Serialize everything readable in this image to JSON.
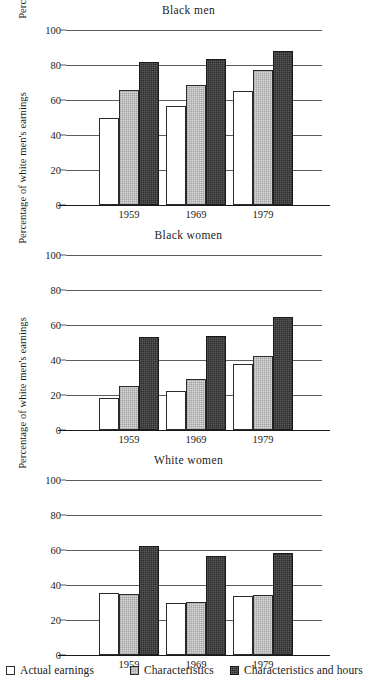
{
  "figure": {
    "ylabel": "Percentage of white men's earnings",
    "y_ticks": [
      "0",
      "20",
      "40",
      "60",
      "80",
      "100"
    ],
    "x_ticks": [
      "1959",
      "1969",
      "1979"
    ],
    "legend": [
      {
        "label": "Actual earnings",
        "swatch": "open-white-square",
        "color": "#ffffff"
      },
      {
        "label": "Characteristics",
        "swatch": "light-gray-stippled-square",
        "color": "#d9d9d9"
      },
      {
        "label": "Characteristics and hours",
        "swatch": "dark-gray-square",
        "color": "#2e2e2e"
      }
    ]
  },
  "panels": [
    {
      "title": "Black men"
    },
    {
      "title": "Black women"
    },
    {
      "title": "White women"
    }
  ],
  "chart_data": [
    {
      "type": "bar",
      "title": "Black men",
      "xlabel": "",
      "ylabel": "Percentage of white men's earnings",
      "categories": [
        "1959",
        "1969",
        "1979"
      ],
      "ylim": [
        0,
        100
      ],
      "yticks": [
        0,
        20,
        40,
        60,
        80,
        100
      ],
      "grid": true,
      "legend_position": "figure-bottom",
      "series": [
        {
          "name": "Actual earnings",
          "values": [
            49.5,
            56.5,
            65
          ]
        },
        {
          "name": "Characteristics",
          "values": [
            66,
            68.5,
            77
          ]
        },
        {
          "name": "Characteristics and hours",
          "values": [
            82,
            83.5,
            88
          ]
        }
      ]
    },
    {
      "type": "bar",
      "title": "Black women",
      "xlabel": "",
      "ylabel": "Percentage of white men's earnings",
      "categories": [
        "1959",
        "1969",
        "1979"
      ],
      "ylim": [
        0,
        100
      ],
      "yticks": [
        0,
        20,
        40,
        60,
        80,
        100
      ],
      "grid": true,
      "legend_position": "figure-bottom",
      "series": [
        {
          "name": "Actual earnings",
          "values": [
            18.5,
            22.5,
            37.5
          ]
        },
        {
          "name": "Characteristics",
          "values": [
            25,
            29,
            42.5
          ]
        },
        {
          "name": "Characteristics and hours",
          "values": [
            53,
            54,
            64.5
          ]
        }
      ]
    },
    {
      "type": "bar",
      "title": "White women",
      "xlabel": "",
      "ylabel": "Percentage of white men's earnings",
      "categories": [
        "1959",
        "1969",
        "1979"
      ],
      "ylim": [
        0,
        100
      ],
      "yticks": [
        0,
        20,
        40,
        60,
        80,
        100
      ],
      "grid": true,
      "legend_position": "figure-bottom",
      "series": [
        {
          "name": "Actual earnings",
          "values": [
            35.5,
            29.5,
            34
          ]
        },
        {
          "name": "Characteristics",
          "values": [
            35,
            30.5,
            34.5
          ]
        },
        {
          "name": "Characteristics and hours",
          "values": [
            62.5,
            56.5,
            58.5
          ]
        }
      ]
    }
  ]
}
